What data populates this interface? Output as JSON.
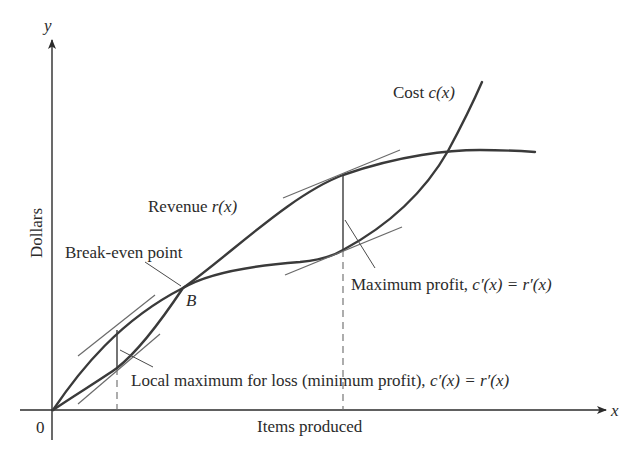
{
  "diagram": {
    "axes": {
      "x_label": "Items produced",
      "y_label": "Dollars",
      "x_var": "x",
      "y_var": "y",
      "origin_label": "0"
    },
    "curves": {
      "revenue": {
        "label_text": "Revenue ",
        "label_func": "r(x)"
      },
      "cost": {
        "label_text": "Cost ",
        "label_func": "c(x)"
      }
    },
    "annotations": {
      "break_even": {
        "text": "Break-even point",
        "point_label": "B"
      },
      "max_profit": {
        "text": "Maximum profit, ",
        "formula": "c′(x) = r′(x)"
      },
      "local_max_loss": {
        "text": "Local maximum for loss (minimum profit), ",
        "formula": "c′(x) = r′(x)"
      }
    },
    "colors": {
      "ink": "#2b2b2b",
      "curve": "#3a3a3a",
      "tangent": "#6a6a6a",
      "background": "#ffffff"
    }
  }
}
